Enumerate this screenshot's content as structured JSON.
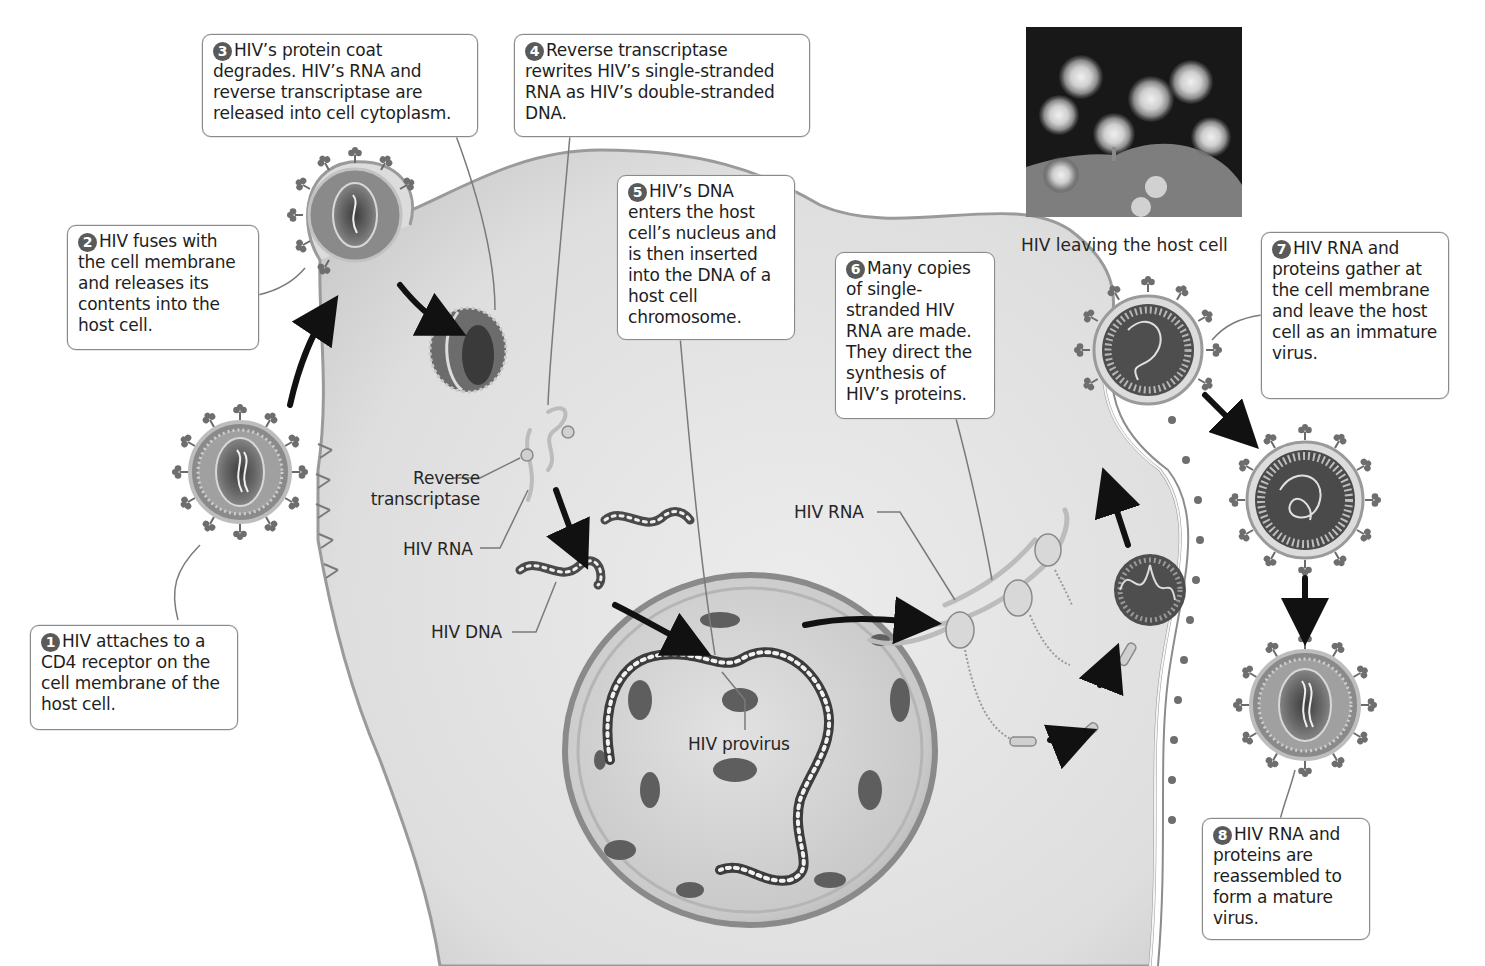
{
  "diagram": {
    "palette": {
      "background": "#ffffff",
      "cytoplasm": "#e4e4e4",
      "cytoplasm_shade": "#c8c8c8",
      "membrane": "#9a9a9a",
      "nucleus": "#d2d2d2",
      "nucleus_pore": "#5e5e5e",
      "virus_dark": "#4a4a4a",
      "arrow": "#111111",
      "callout_border": "#8a8a8a",
      "step_badge": "#5a5a5a"
    },
    "steps": [
      {
        "number": "1",
        "text": "HIV attaches to a CD4 receptor on the cell membrane of the host cell."
      },
      {
        "number": "2",
        "text": "HIV fuses with the cell membrane and releases its contents into the host cell."
      },
      {
        "number": "3",
        "text": "HIV’s protein coat degrades. HIV’s RNA and reverse transcriptase are released into cell cytoplasm."
      },
      {
        "number": "4",
        "text": "Reverse transcriptase rewrites HIV’s single-stranded RNA as HIV’s double-stranded DNA."
      },
      {
        "number": "5",
        "text": "HIV’s DNA enters the host cell’s nucleus and is then inserted into the DNA of a host cell chromosome."
      },
      {
        "number": "6",
        "text": "Many copies of single-stranded HIV RNA are made. They direct the synthesis of HIV’s proteins."
      },
      {
        "number": "7",
        "text": "HIV RNA and proteins gather at the cell membrane and leave the host cell as an immature virus."
      },
      {
        "number": "8",
        "text": "HIV RNA and proteins are reassembled to form a mature virus."
      }
    ],
    "labels": {
      "reverse_transcriptase_1": "Reverse",
      "reverse_transcriptase_2": "transcriptase",
      "hiv_rna_left": "HIV RNA",
      "hiv_dna": "HIV DNA",
      "hiv_provirus": "HIV provirus",
      "hiv_rna_right": "HIV RNA"
    },
    "photo": {
      "caption": "HIV leaving the host cell",
      "description": "micrograph of virus particles budding from a cell surface"
    },
    "structures": [
      "hiv-virion-attaching",
      "hiv-virion-fusing",
      "degrading-capsid",
      "reverse-transcriptase-with-rna",
      "hiv-dna-fragments",
      "host-nucleus",
      "hiv-provirus-chromosome",
      "ribosomes-translating-rna",
      "assembling-capsid",
      "budding-immature-virus",
      "released-immature-virus",
      "mature-virus"
    ]
  }
}
